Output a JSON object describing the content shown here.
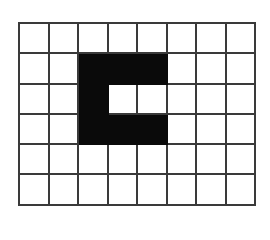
{
  "grid": {
    "rows": 6,
    "cols": 8,
    "line_color": "#3a3a3a",
    "fill_color": "#0a0a0a",
    "background": "#ffffff",
    "cells": [
      [
        0,
        0,
        0,
        0,
        0,
        0,
        0,
        0
      ],
      [
        0,
        0,
        1,
        1,
        1,
        0,
        0,
        0
      ],
      [
        0,
        0,
        1,
        0,
        0,
        0,
        0,
        0
      ],
      [
        0,
        0,
        1,
        1,
        1,
        0,
        0,
        0
      ],
      [
        0,
        0,
        0,
        0,
        0,
        0,
        0,
        0
      ],
      [
        0,
        0,
        0,
        0,
        0,
        0,
        0,
        0
      ]
    ]
  }
}
